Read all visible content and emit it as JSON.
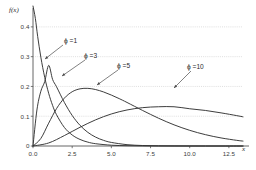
{
  "chart_data": {
    "type": "line",
    "title": "",
    "subtitle": "",
    "xlabel": "x",
    "ylabel": "f(x)",
    "xlim": [
      0,
      13.4
    ],
    "ylim": [
      0,
      0.45
    ],
    "grid": true,
    "grid_style": "dotted-horizontal",
    "legend": "inline-annotations",
    "xticks": [
      "0.0",
      "2.5",
      "5.0",
      "7.5",
      "10.0",
      "12.5"
    ],
    "xtick_values": [
      0.0,
      2.5,
      5.0,
      7.5,
      10.0,
      12.5
    ],
    "yticks": [
      "0",
      "0.1",
      "0.2",
      "0.3",
      "0.4"
    ],
    "ytick_values": [
      0,
      0.1,
      0.2,
      0.3,
      0.4
    ],
    "line_color": "#333333",
    "grid_color": "#c9c9c9",
    "axis_color": "#555555",
    "series": [
      {
        "name": "ϕ =1",
        "phi": 1,
        "peak_x": 0.0,
        "peak_y": 0.5,
        "x": [
          0.0,
          0.15,
          0.3,
          0.5,
          0.75,
          1.0,
          1.25,
          1.5,
          2.0,
          2.5,
          3.0,
          3.5,
          4.0,
          5.0,
          6.0,
          7.0,
          8.0,
          9.0,
          10.0,
          11.0,
          12.0,
          13.0,
          13.4
        ],
        "y": [
          0.5,
          0.4286,
          0.3674,
          0.2983,
          0.2298,
          0.177,
          0.1364,
          0.1051,
          0.0624,
          0.037,
          0.022,
          0.013,
          0.0077,
          0.0027,
          0.001,
          0.0003,
          0.0001,
          0.0001,
          0.0,
          0.0,
          0.0,
          0.0,
          0.0
        ]
      },
      {
        "name": "ϕ =3",
        "phi": 3,
        "peak_x": 1.0,
        "peak_y": 0.2707,
        "x": [
          0.0,
          0.25,
          0.5,
          0.75,
          1.0,
          1.25,
          1.5,
          2.0,
          2.5,
          3.0,
          3.5,
          4.0,
          4.5,
          5.0,
          6.0,
          7.0,
          8.0,
          9.0,
          10.0,
          11.0,
          12.0,
          13.0,
          13.4
        ],
        "y": [
          0.0,
          0.1208,
          0.1839,
          0.2166,
          0.2707,
          0.2236,
          0.1991,
          0.1465,
          0.1026,
          0.0694,
          0.0458,
          0.0297,
          0.019,
          0.012,
          0.0045,
          0.0016,
          0.0006,
          0.0002,
          0.0001,
          0.0,
          0.0,
          0.0,
          0.0
        ]
      },
      {
        "name": "ϕ =5",
        "phi": 5,
        "peak_x": 3.6,
        "peak_y": 0.1954,
        "x": [
          0.0,
          0.5,
          1.0,
          1.5,
          2.0,
          2.5,
          3.0,
          3.5,
          4.0,
          4.5,
          5.0,
          5.5,
          6.0,
          7.0,
          8.0,
          9.0,
          10.0,
          11.0,
          12.0,
          13.0,
          13.4
        ],
        "y": [
          0.0,
          0.0253,
          0.0766,
          0.1255,
          0.1607,
          0.1822,
          0.192,
          0.1936,
          0.1895,
          0.1815,
          0.171,
          0.1591,
          0.1462,
          0.1192,
          0.0936,
          0.0711,
          0.0526,
          0.0381,
          0.0271,
          0.019,
          0.0165
        ]
      },
      {
        "name": "ϕ =10",
        "phi": 10,
        "peak_x": 9.0,
        "peak_y": 0.1318,
        "x": [
          0.0,
          1.0,
          2.0,
          3.0,
          4.0,
          5.0,
          6.0,
          7.0,
          8.0,
          9.0,
          10.0,
          11.0,
          12.0,
          13.0,
          13.4
        ],
        "y": [
          0.0,
          0.0102,
          0.035,
          0.0629,
          0.088,
          0.1076,
          0.121,
          0.1288,
          0.1318,
          0.1318,
          0.1251,
          0.1194,
          0.1113,
          0.102,
          0.098
        ]
      }
    ],
    "annotations": [
      {
        "id": "phi-1",
        "text": "ϕ =1",
        "label_x": 64,
        "label_y": 37,
        "arrow_from_x": 63,
        "arrow_from_y": 45,
        "arrow_to_x": 45,
        "arrow_to_y": 59
      },
      {
        "id": "phi-3",
        "text": "ϕ =3",
        "label_x": 84,
        "label_y": 52,
        "arrow_from_x": 85,
        "arrow_from_y": 60,
        "arrow_to_x": 62,
        "arrow_to_y": 76
      },
      {
        "id": "phi-5",
        "text": "ϕ =5",
        "label_x": 117,
        "label_y": 62,
        "arrow_from_x": 118,
        "arrow_from_y": 70,
        "arrow_to_x": 97,
        "arrow_to_y": 85
      },
      {
        "id": "phi-10",
        "text": "ϕ =10",
        "label_x": 187,
        "label_y": 63,
        "arrow_from_x": 191,
        "arrow_from_y": 71,
        "arrow_to_x": 174,
        "arrow_to_y": 88
      }
    ]
  },
  "axis": {
    "y_title": "f(x)",
    "x_title": "x"
  }
}
